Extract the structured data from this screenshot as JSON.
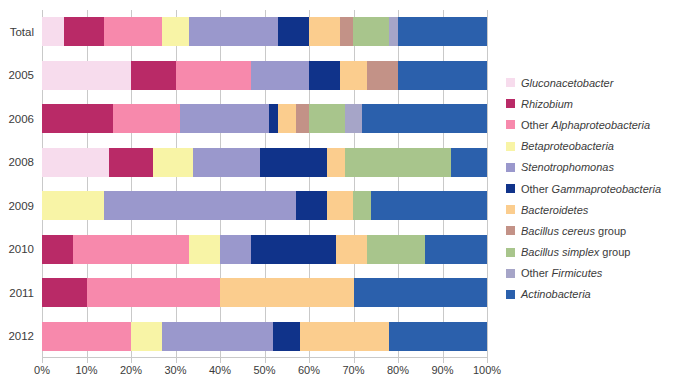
{
  "chart_data": {
    "type": "bar",
    "orientation": "horizontal",
    "stacked": true,
    "title": "",
    "xlabel": "",
    "ylabel": "",
    "xlim": [
      0,
      100
    ],
    "grid": true,
    "legend_position": "right",
    "xticks": [
      "0%",
      "10%",
      "20%",
      "30%",
      "40%",
      "50%",
      "60%",
      "70%",
      "80%",
      "90%",
      "100%"
    ],
    "xtick_values": [
      0,
      10,
      20,
      30,
      40,
      50,
      60,
      70,
      80,
      90,
      100
    ],
    "categories": [
      "Total",
      "2005",
      "2006",
      "2008",
      "2009",
      "2010",
      "2011",
      "2012"
    ],
    "series": [
      {
        "name": "Gluconacetobacter",
        "color": "#f7dced",
        "values": [
          5,
          20,
          0,
          15,
          0,
          0,
          0,
          0
        ]
      },
      {
        "name": "Rhizobium",
        "color": "#b92a67",
        "values": [
          9,
          10,
          16,
          10,
          0,
          7,
          10,
          0
        ]
      },
      {
        "name": "Other Alphaproteobacteria",
        "color": "#f789ac",
        "values": [
          13,
          17,
          15,
          0,
          0,
          26,
          30,
          20
        ]
      },
      {
        "name": "Betaproteobacteria",
        "color": "#f8f4a6",
        "values": [
          6,
          0,
          0,
          9,
          14,
          7,
          0,
          7
        ]
      },
      {
        "name": "Stenotrophomonas",
        "color": "#9a98cc",
        "values": [
          20,
          13,
          20,
          15,
          43,
          7,
          0,
          25
        ]
      },
      {
        "name": "Other Gammaproteobacteria",
        "color": "#10338a",
        "values": [
          7,
          7,
          2,
          15,
          7,
          19,
          0,
          6
        ]
      },
      {
        "name": "Bacteroidetes",
        "color": "#fbcd8e",
        "values": [
          7,
          6,
          4,
          4,
          6,
          7,
          30,
          20
        ]
      },
      {
        "name": "Bacillus cereus group",
        "color": "#c39287",
        "values": [
          3,
          7,
          3,
          0,
          0,
          0,
          0,
          0
        ]
      },
      {
        "name": "Bacillus simplex group",
        "color": "#a8c58c",
        "values": [
          8,
          0,
          8,
          24,
          4,
          13,
          0,
          0
        ]
      },
      {
        "name": "Other Firmicutes",
        "color": "#a6a5c8",
        "values": [
          2,
          0,
          4,
          0,
          0,
          0,
          0,
          0
        ]
      },
      {
        "name": "Actinobacteria",
        "color": "#2b60ac",
        "values": [
          20,
          20,
          28,
          8,
          26,
          14,
          30,
          22
        ]
      }
    ]
  },
  "legend": {
    "entries": [
      {
        "label_italic": "Gluconacetobacter",
        "label_roman": "",
        "swatch_name": "legend-swatch-gluconacetobacter"
      },
      {
        "label_italic": "Rhizobium",
        "label_roman": "",
        "swatch_name": "legend-swatch-rhizobium"
      },
      {
        "label_italic": "Alphaproteobacteria",
        "label_roman": "Other ",
        "swatch_name": "legend-swatch-other-alphaproteobacteria"
      },
      {
        "label_italic": "Betaproteobacteria",
        "label_roman": "",
        "swatch_name": "legend-swatch-betaproteobacteria"
      },
      {
        "label_italic": "Stenotrophomonas",
        "label_roman": "",
        "swatch_name": "legend-swatch-stenotrophomonas"
      },
      {
        "label_italic": "Gammaproteobacteria",
        "label_roman": "Other ",
        "swatch_name": "legend-swatch-other-gammaproteobacteria"
      },
      {
        "label_italic": "Bacteroidetes",
        "label_roman": "",
        "swatch_name": "legend-swatch-bacteroidetes"
      },
      {
        "label_italic": "Bacillus cereus",
        "label_roman": " group",
        "swatch_name": "legend-swatch-bacillus-cereus-group"
      },
      {
        "label_italic": "Bacillus simplex",
        "label_roman": " group",
        "swatch_name": "legend-swatch-bacillus-simplex-group"
      },
      {
        "label_italic": "Firmicutes",
        "label_roman": "Other ",
        "swatch_name": "legend-swatch-other-firmicutes"
      },
      {
        "label_italic": "Actinobacteria",
        "label_roman": "",
        "swatch_name": "legend-swatch-actinobacteria"
      }
    ]
  },
  "style": {
    "gridline_color": "#c9c9c9",
    "text_color": "#3b3b3b",
    "background": "#ffffff"
  }
}
